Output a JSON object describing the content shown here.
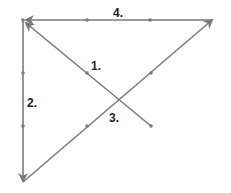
{
  "diagram": {
    "colors": {
      "line": "#7a7a7a",
      "dot": "#7a7a7a",
      "label": "#222222"
    },
    "labels": {
      "l1": "1.",
      "l2": "2.",
      "l3": "3.",
      "l4": "4."
    },
    "segments": [
      {
        "id": 1,
        "label": "1.",
        "from": [
          151,
          126
        ],
        "to": [
          23,
          21
        ],
        "arrow_at": "end"
      },
      {
        "id": 2,
        "label": "2.",
        "from": [
          23,
          21
        ],
        "to": [
          23,
          182
        ],
        "arrow_at": "end"
      },
      {
        "id": 3,
        "label": "3.",
        "from": [
          23,
          182
        ],
        "to": [
          214,
          18
        ],
        "arrow_at": "end"
      },
      {
        "id": 4,
        "label": "4.",
        "from": [
          214,
          20
        ],
        "to": [
          23,
          20
        ],
        "arrow_at": "end"
      }
    ],
    "grid_dots": [
      [
        87,
        20
      ],
      [
        150,
        20
      ],
      [
        23,
        73
      ],
      [
        23,
        126
      ],
      [
        87,
        73
      ],
      [
        151,
        73
      ],
      [
        87,
        126
      ],
      [
        151,
        126
      ],
      [
        23,
        20
      ]
    ]
  }
}
